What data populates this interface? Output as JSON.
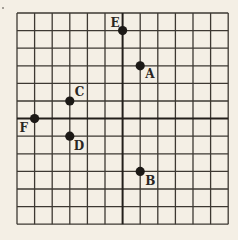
{
  "diagram": {
    "type": "coordinate-grid",
    "background": "#f4efe5",
    "line_color": "#3d3832",
    "axis_color": "#231f1b",
    "grid": {
      "left": 17,
      "top": 13,
      "cell": 17.6,
      "cols": 12,
      "rows": 12,
      "origin_col": 6,
      "origin_row": 6
    },
    "stray_mark": {
      "x": 3,
      "y": 8
    },
    "points": [
      {
        "label": "E",
        "x": 0,
        "y": 5,
        "label_dx": -12,
        "label_dy": -4
      },
      {
        "label": "A",
        "x": 1,
        "y": 3,
        "label_dx": 5,
        "label_dy": 12
      },
      {
        "label": "C",
        "x": -3,
        "y": 1,
        "label_dx": 5,
        "label_dy": -5
      },
      {
        "label": "F",
        "x": -5,
        "y": 0,
        "label_dx": -15,
        "label_dy": 13
      },
      {
        "label": "D",
        "x": -3,
        "y": -1,
        "label_dx": 4,
        "label_dy": 14
      },
      {
        "label": "B",
        "x": 1,
        "y": -3,
        "label_dx": 5,
        "label_dy": 14
      }
    ]
  }
}
